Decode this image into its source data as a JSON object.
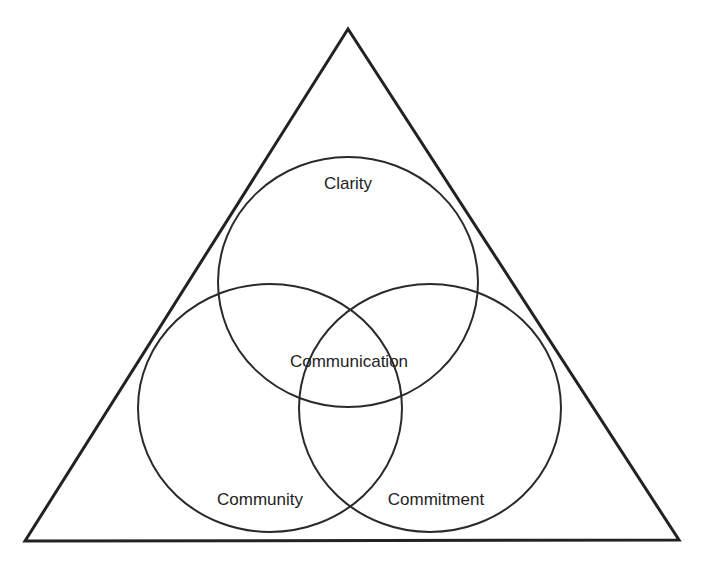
{
  "diagram": {
    "type": "venn-in-triangle",
    "colors": {
      "stroke": "#222222",
      "background": "#ffffff",
      "text": "#1e1e1e"
    },
    "triangle": {
      "points": [
        [
          348,
          29
        ],
        [
          25,
          541
        ],
        [
          679,
          540
        ]
      ]
    },
    "circles": [
      {
        "id": "clarity",
        "cx": 348,
        "cy": 282,
        "rx": 130,
        "ry": 125
      },
      {
        "id": "community",
        "cx": 270,
        "cy": 408,
        "rx": 132,
        "ry": 124
      },
      {
        "id": "commitment",
        "cx": 430,
        "cy": 408,
        "rx": 131,
        "ry": 124
      }
    ],
    "labels": {
      "clarity": "Clarity",
      "communication": "Communication",
      "community": "Community",
      "commitment": "Commitment"
    }
  }
}
